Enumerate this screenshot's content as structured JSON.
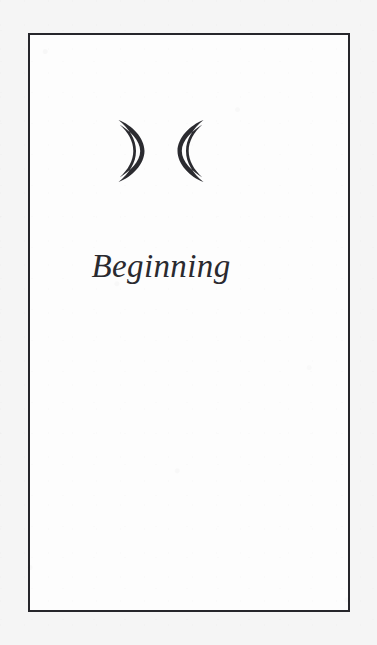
{
  "page": {
    "background_color": "#f5f5f5",
    "panel_color": "#fdfdfd",
    "border_color": "#26262b",
    "ink_color": "#2a2a2f"
  },
  "card": {
    "title": "Beginning",
    "symbols": [
      {
        "name": "waxing-crescent-moon-icon",
        "direction": "opens-left"
      },
      {
        "name": "waning-crescent-moon-icon",
        "direction": "opens-right"
      }
    ]
  }
}
